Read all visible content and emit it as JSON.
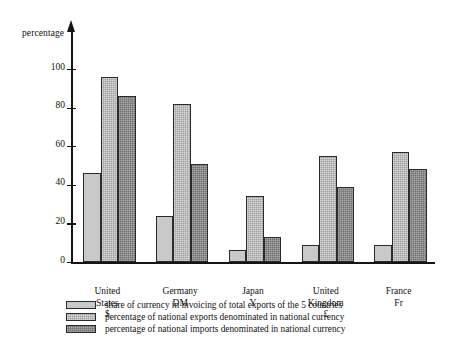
{
  "chart_data": {
    "type": "bar",
    "title": "",
    "subtitle": "",
    "xlabel": "",
    "ylabel": "percentage",
    "ylim": [
      0,
      110
    ],
    "yticks": [
      0,
      20,
      40,
      60,
      80,
      100
    ],
    "grid": false,
    "legend_position": "below",
    "categories": [
      "United States",
      "Germany",
      "Japan",
      "United Kingdom",
      "France"
    ],
    "category_symbols": [
      "$",
      "DM",
      "Y",
      "£",
      "Fr"
    ],
    "series": [
      {
        "name": "share of currency in invoicing of total exports of the 5 countries",
        "values": [
          46,
          24,
          6,
          9,
          9
        ]
      },
      {
        "name": "percentage of national exports denominated in national currency",
        "values": [
          96,
          82,
          34,
          55,
          57
        ]
      },
      {
        "name": "percentage of national imports denominated in national currency",
        "values": [
          86,
          51,
          13,
          39,
          48
        ]
      }
    ]
  },
  "legend": {
    "items": [
      {
        "swatch": "light-gray-swatch",
        "label": "share of currency in invoicing of total exports of the 5 countries"
      },
      {
        "swatch": "medium-gray-swatch",
        "label": "percentage of national exports denominated in national currency"
      },
      {
        "swatch": "dark-gray-swatch",
        "label": "percentage of national imports denominated in national currency"
      }
    ]
  },
  "colors": {
    "series_1": "#c9c9c9",
    "series_2": "#a0a0a0",
    "series_3": "#6e6e6e",
    "axis": "#151515",
    "background": "#ffffff"
  }
}
